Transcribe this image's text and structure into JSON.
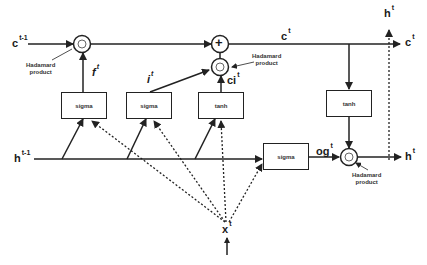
{
  "diagram": {
    "type": "LSTM cell",
    "inputs": {
      "prev_cell": {
        "base": "c",
        "sup": "t-1"
      },
      "prev_hidden": {
        "base": "h",
        "sup": "t-1"
      },
      "input": {
        "base": "x",
        "sup": "t"
      }
    },
    "outputs": {
      "cell_top": {
        "base": "c",
        "sup": "t"
      },
      "cell_right": {
        "base": "c",
        "sup": "t"
      },
      "hidden_top": {
        "base": "h",
        "sup": "t"
      },
      "hidden_right": {
        "base": "h",
        "sup": "t"
      }
    },
    "gates": {
      "forget": {
        "box": "sigma",
        "out": {
          "base": "f",
          "sup": "t"
        }
      },
      "input": {
        "box": "sigma",
        "out": {
          "base": "i",
          "sup": "t"
        }
      },
      "candidate": {
        "box": "tanh",
        "out": {
          "base": "ci",
          "sup": "t"
        }
      },
      "output": {
        "box": "sigma",
        "out": {
          "base": "og",
          "sup": "t"
        }
      },
      "cell_activation": {
        "box": "tanh"
      }
    },
    "annotations": {
      "hadamard_1": [
        "Hadamard",
        "product"
      ],
      "hadamard_2": [
        "Hadamard",
        "product"
      ],
      "hadamard_3": [
        "Hadamard",
        "product"
      ]
    },
    "operators": {
      "add": "+"
    },
    "colors": {
      "line": "#222222",
      "background": "#ffffff"
    }
  }
}
